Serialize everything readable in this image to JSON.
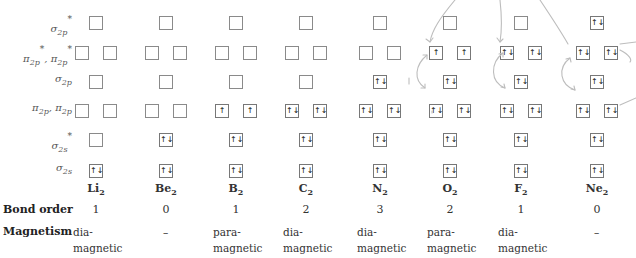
{
  "title_fragment": "… p… … … … …",
  "row_labels": [
    {
      "id": "sigma2p_star",
      "main": "σ",
      "sub": "2p",
      "sup": "*",
      "y": 23
    },
    {
      "id": "pi2p_star",
      "main": "π",
      "sub": "2p",
      "sup": "*",
      "y": 53,
      "double": true
    },
    {
      "id": "sigma2p",
      "main": "σ",
      "sub": "2p",
      "sup": "",
      "y": 82
    },
    {
      "id": "pi2p",
      "main": "π",
      "sub": "2p",
      "sup": "",
      "y": 111,
      "double": true
    },
    {
      "id": "sigma2s_star",
      "main": "σ",
      "sub": "2s",
      "sup": "*",
      "y": 140
    },
    {
      "id": "sigma2s",
      "main": "σ",
      "sub": "2s",
      "sup": "",
      "y": 171
    }
  ],
  "label_text": {
    "sigma2p_star": "σ2p*",
    "pi2p_star": "π2p*, π2p*",
    "sigma2p": "σ2p",
    "pi2p": "π2p, π2p",
    "sigma2s_star": "σ2s*",
    "sigma2s": "σ2s"
  },
  "molecules": [
    {
      "name": "Li",
      "sub": "2",
      "bond_order": "1",
      "magnetism": "dia-\nmagnetic",
      "orbitals": {
        "sigma2s": "↑↓",
        "sigma2s_star": "",
        "pi2p": [
          "",
          ""
        ],
        "sigma2p": "",
        "pi2p_star": [
          "",
          ""
        ],
        "sigma2p_star": ""
      }
    },
    {
      "name": "Be",
      "sub": "2",
      "bond_order": "0",
      "magnetism": "–",
      "orbitals": {
        "sigma2s": "↑↓",
        "sigma2s_star": "↑↓",
        "pi2p": [
          "",
          ""
        ],
        "sigma2p": "",
        "pi2p_star": [
          "",
          ""
        ],
        "sigma2p_star": ""
      }
    },
    {
      "name": "B",
      "sub": "2",
      "bond_order": "1",
      "magnetism": "para-\nmagnetic",
      "orbitals": {
        "sigma2s": "↑↓",
        "sigma2s_star": "↑↓",
        "pi2p": [
          "↑",
          "↑"
        ],
        "sigma2p": "",
        "pi2p_star": [
          "",
          ""
        ],
        "sigma2p_star": ""
      }
    },
    {
      "name": "C",
      "sub": "2",
      "bond_order": "2",
      "magnetism": "dia-\nmagnetic",
      "orbitals": {
        "sigma2s": "↑↓",
        "sigma2s_star": "↑↓",
        "pi2p": [
          "↑↓",
          "↑↓"
        ],
        "sigma2p": "",
        "pi2p_star": [
          "",
          ""
        ],
        "sigma2p_star": ""
      }
    },
    {
      "name": "N",
      "sub": "2",
      "bond_order": "3",
      "magnetism": "dia-\nmagnetic",
      "orbitals": {
        "sigma2s": "↑↓",
        "sigma2s_star": "↑↓",
        "pi2p": [
          "↑↓",
          "↑↓"
        ],
        "sigma2p": "↑↓",
        "pi2p_star": [
          "",
          ""
        ],
        "sigma2p_star": ""
      }
    },
    {
      "name": "O",
      "sub": "2",
      "bond_order": "2",
      "magnetism": "para-\nmagnetic",
      "orbitals": {
        "sigma2s": "↑↓",
        "sigma2s_star": "↑↓",
        "pi2p": [
          "↑↓",
          "↑↓"
        ],
        "sigma2p": "↑↓",
        "pi2p_star": [
          "↑",
          "↑"
        ],
        "sigma2p_star": ""
      }
    },
    {
      "name": "F",
      "sub": "2",
      "bond_order": "1",
      "magnetism": "dia-\nmagnetic",
      "orbitals": {
        "sigma2s": "↑↓",
        "sigma2s_star": "↑↓",
        "pi2p": [
          "↑↓",
          "↑↓"
        ],
        "sigma2p": "↑↓",
        "pi2p_star": [
          "↑↓",
          "↑↓"
        ],
        "sigma2p_star": ""
      }
    },
    {
      "name": "Ne",
      "sub": "2",
      "bond_order": "0",
      "magnetism": "–",
      "orbitals": {
        "sigma2s": "↑↓",
        "sigma2s_star": "↑↓",
        "pi2p": [
          "↑↓",
          "↑↓"
        ],
        "sigma2p": "↑↓",
        "pi2p_star": [
          "↑↓",
          "↑↓"
        ],
        "sigma2p_star": "↑↓"
      }
    }
  ],
  "row_headers": {
    "bond_order": "Bond order",
    "magnetism": "Magnetism"
  },
  "mol_labels": [
    "Li2",
    "Be2",
    "B2",
    "C2",
    "N2",
    "O2",
    "F2",
    "Ne2"
  ],
  "bond_orders": [
    "1",
    "0",
    "1",
    "2",
    "3",
    "2",
    "1",
    "0"
  ],
  "magnetism": [
    "dia-\nmagnetic",
    "–",
    "para-\nmagnetic",
    "dia-\nmagnetic",
    "dia-\nmagnetic",
    "para-\nmagnetic",
    "dia-\nmagnetic",
    "–"
  ],
  "colors": {
    "box_border": "#8a8a8a",
    "text": "#333333",
    "annotation": "#b5b5b5"
  }
}
